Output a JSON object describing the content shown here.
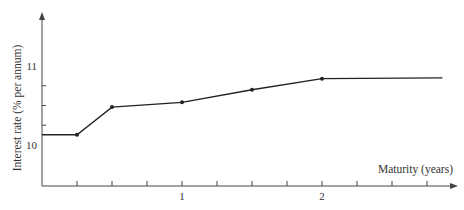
{
  "chart_data": {
    "type": "line",
    "title": "",
    "xlabel": "Maturity (years)",
    "ylabel": "Interest rate (% per annum)",
    "xlim": [
      0,
      3.0
    ],
    "ylim": [
      9.47,
      11.5
    ],
    "x_ticks": [
      0.25,
      0.5,
      0.75,
      1,
      1.25,
      1.5,
      1.75,
      2,
      2.25,
      2.5,
      2.75
    ],
    "x_tick_labels": [
      {
        "value": 1,
        "label": "1"
      },
      {
        "value": 2,
        "label": "2"
      }
    ],
    "y_ticks": [
      10,
      10.25,
      10.5,
      10.75,
      11
    ],
    "y_tick_labels": [
      {
        "value": 10,
        "label": "10"
      },
      {
        "value": 11,
        "label": "11"
      }
    ],
    "grid": false,
    "legend": null,
    "series": [
      {
        "name": "Zero curve",
        "x": [
          0,
          0.25,
          0.5,
          1.0,
          1.5,
          2.0,
          2.86
        ],
        "y": [
          10.13,
          10.13,
          10.48,
          10.54,
          10.7,
          10.84,
          10.85
        ],
        "markers": [
          false,
          true,
          true,
          true,
          true,
          true,
          false
        ]
      }
    ]
  },
  "colors": {
    "axis": "#444444",
    "line": "#222222",
    "text": "#333333"
  }
}
